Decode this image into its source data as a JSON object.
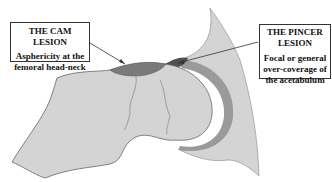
{
  "labels": {
    "cam": {
      "title": "THE CAM LESION",
      "description_line1": "Asphericity at the",
      "description_line2": "femoral head-neck"
    },
    "pincer": {
      "title_line1": "THE PINCER",
      "title_line2": "LESION",
      "description_line1": "Focal or general",
      "description_line2": "over-coverage of",
      "description_line3": "the acetabulum"
    }
  },
  "colors": {
    "bone": "#d4d4d4",
    "cartilage": "#9a9a9a",
    "lesion": "#7a7a7a",
    "pincer_tip": "#505050",
    "outline": "#333333",
    "background": "#ffffff"
  }
}
